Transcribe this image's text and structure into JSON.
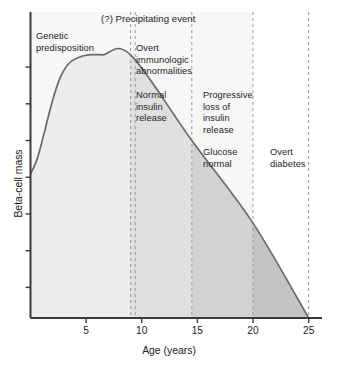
{
  "chart_data": {
    "type": "area",
    "title": "",
    "xlabel": "Age (years)",
    "ylabel": "Beta-cell mass",
    "xlim": [
      0,
      26.2
    ],
    "ylim": [
      0,
      100
    ],
    "xticks": [
      5,
      10,
      15,
      20,
      25
    ],
    "xtick_labels": [
      "5",
      "10",
      "15",
      "20",
      "25"
    ],
    "yticks": [
      10,
      22,
      34,
      46,
      58,
      70,
      82
    ],
    "ytick_labels": [
      "",
      "",
      "",
      "",
      "",
      "",
      ""
    ],
    "grid": false,
    "legend": "none",
    "series": [
      {
        "name": "Beta-cell mass",
        "x": [
          0,
          0.6,
          1.2,
          1.9,
          2.6,
          3.4,
          4.2,
          5.2,
          6.5,
          9.0,
          14.5,
          20.0,
          25.0
        ],
        "values": [
          47,
          52,
          60,
          70,
          78,
          83,
          85,
          86,
          86,
          86,
          58,
          31,
          0
        ]
      }
    ],
    "phase_boundaries": [
      9.0,
      14.5,
      20.0,
      25.0
    ],
    "phase_fills": [
      "#ececec",
      "#e0e0e0",
      "#d2d2d2",
      "#c4c4c4"
    ],
    "curve_color": "#6b6b6b",
    "axis_color": "#3a3a3a",
    "dash_color": "#9a9a9a"
  },
  "annotations": {
    "precipitating_event": "(?) Precipitating event",
    "genetic_predisposition": "Genetic\npredisposition",
    "overt_immunologic": "Overt\nimmunologic\nabnormalities",
    "normal_insulin_release": "Normal\ninsulin\nrelease",
    "progressive_loss": "Progressive\nloss of\ninsulin\nrelease",
    "glucose_normal": "Glucose\nnormal",
    "overt_diabetes": "Overt\ndiabetes"
  }
}
